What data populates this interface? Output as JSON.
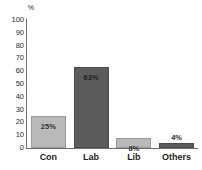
{
  "chart_data": {
    "type": "bar",
    "title": "",
    "subtitle": "",
    "xlabel": "",
    "ylabel": "%",
    "ylim": [
      0,
      100
    ],
    "ytick_step": 10,
    "yticks": [
      "100",
      "90",
      "80",
      "70",
      "60",
      "50",
      "40",
      "30",
      "20",
      "10",
      "0"
    ],
    "ytick_values": [
      100,
      90,
      80,
      70,
      60,
      50,
      40,
      30,
      20,
      10,
      0
    ],
    "grid": false,
    "legend": false,
    "categories": [
      "Con",
      "Lab",
      "Lib",
      "Others"
    ],
    "values": [
      25,
      63,
      8,
      4
    ],
    "data_labels": [
      "25%",
      "63%",
      "8%",
      "4%"
    ],
    "label_placement": [
      "inside",
      "inside",
      "inside",
      "above"
    ],
    "bar_colors": [
      "#b9b9b9",
      "#5c5c5c",
      "#b9b9b9",
      "#5c5c5c"
    ],
    "bar_shades": [
      "light",
      "dark",
      "light",
      "dark"
    ],
    "axis_color": "#6e6e6e",
    "background_color": "#fefefe",
    "text_color": "#1f1f1f"
  }
}
